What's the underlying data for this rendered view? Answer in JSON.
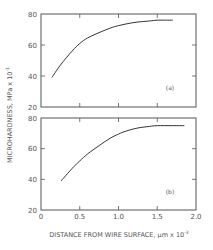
{
  "figure": {
    "ylabel": "MICROHARDNESS, MPa x 10",
    "ylabel_exp": "-1",
    "xlabel": "DISTANCE FROM WIRE SURFACE, μm x 10",
    "xlabel_exp": "-3",
    "line_color": "#333333",
    "axis_color": "#555555"
  },
  "chart_data": [
    {
      "type": "line",
      "title": "(a)",
      "panel_label": "(a)",
      "xlabel": "DISTANCE FROM WIRE SURFACE, μm x 10^-3",
      "ylabel": "MICROHARDNESS, MPa x 10^-1",
      "xlim": [
        0,
        2.0
      ],
      "ylim": [
        20,
        80
      ],
      "xticks": [
        0,
        0.5,
        1.0,
        1.5,
        2.0
      ],
      "yticks": [
        20,
        40,
        60,
        80
      ],
      "ytick_labels": [
        "20",
        "40",
        "60",
        "80"
      ],
      "xtick_labels": [],
      "grid": false,
      "series": [
        {
          "name": "(a)",
          "x": [
            0.14,
            0.25,
            0.4,
            0.5,
            0.6,
            0.75,
            0.9,
            1.0,
            1.2,
            1.4,
            1.5,
            1.7
          ],
          "y": [
            39,
            47,
            56,
            61,
            64.5,
            68,
            71,
            72.5,
            74.5,
            75.5,
            76,
            76
          ]
        }
      ]
    },
    {
      "type": "line",
      "title": "(b)",
      "panel_label": "(b)",
      "xlabel": "DISTANCE FROM WIRE SURFACE, μm x 10^-3",
      "ylabel": "MICROHARDNESS, MPa x 10^-1",
      "xlim": [
        0,
        2.0
      ],
      "ylim": [
        20,
        80
      ],
      "xticks": [
        0,
        0.5,
        1.0,
        1.5,
        2.0
      ],
      "yticks": [
        20,
        40,
        60,
        80
      ],
      "ytick_labels": [
        "20",
        "40",
        "60",
        "80"
      ],
      "xtick_labels": [
        "0",
        "0.5",
        "1.0",
        "1.5",
        "2.0"
      ],
      "grid": false,
      "series": [
        {
          "name": "(b)",
          "x": [
            0.26,
            0.4,
            0.5,
            0.6,
            0.75,
            0.9,
            1.0,
            1.1,
            1.25,
            1.4,
            1.5,
            1.7,
            1.85
          ],
          "y": [
            39,
            47,
            52,
            56.5,
            62,
            67,
            69.5,
            71.5,
            73.5,
            74.5,
            75,
            75,
            75
          ]
        }
      ]
    }
  ]
}
